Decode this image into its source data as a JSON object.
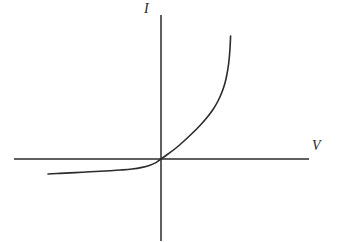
{
  "figure": {
    "background_color": "#ffffff",
    "line_color": "#2b2b2b",
    "width": 339,
    "height": 242
  },
  "labels": {
    "y_axis": "I",
    "x_axis": "V"
  },
  "chart_data": {
    "type": "line",
    "title": "",
    "subtitle": "",
    "xlabel": "V",
    "ylabel": "I",
    "grid": false,
    "legend": null,
    "axes": {
      "origin_px": [
        161,
        159
      ],
      "x_axis_px": {
        "y": 159,
        "x_start": 14,
        "x_end": 309
      },
      "y_axis_px": {
        "x": 161,
        "y_start": 15,
        "y_end": 241
      },
      "x_axis_label_position": "right-end-above",
      "y_axis_label_position": "top-end-left",
      "xlim": [
        -1.0,
        0.78
      ],
      "ylim": [
        -0.12,
        0.96
      ],
      "tick_labels_x": [],
      "tick_labels_y": [],
      "arrowheads": false
    },
    "series": [
      {
        "name": "Diode I-V curve",
        "description": "Exponential forward bias with small negative reverse saturation current",
        "color": "#2b2b2b",
        "line_width_px": 1.6,
        "points_px": [
          [
            48,
            174
          ],
          [
            60,
            173.4
          ],
          [
            75,
            172.6
          ],
          [
            90,
            171.8
          ],
          [
            105,
            171.0
          ],
          [
            120,
            170.0
          ],
          [
            132,
            169.0
          ],
          [
            142,
            167.4
          ],
          [
            150,
            165.2
          ],
          [
            156,
            162.6
          ],
          [
            161,
            159.0
          ],
          [
            168,
            154.0
          ],
          [
            176,
            148.0
          ],
          [
            184,
            141.0
          ],
          [
            192,
            133.5
          ],
          [
            200,
            125.5
          ],
          [
            207,
            117.5
          ],
          [
            213,
            109.5
          ],
          [
            218,
            101.0
          ],
          [
            222,
            92.0
          ],
          [
            225,
            83.0
          ],
          [
            227,
            74.0
          ],
          [
            228.6,
            64.0
          ],
          [
            229.6,
            54.0
          ],
          [
            230.2,
            45.0
          ],
          [
            230.6,
            36.0
          ]
        ],
        "points_data": [
          [
            -0.72,
            -0.064
          ],
          [
            -0.64,
            -0.061
          ],
          [
            -0.54,
            -0.058
          ],
          [
            -0.44,
            -0.055
          ],
          [
            -0.34,
            -0.052
          ],
          [
            -0.24,
            -0.048
          ],
          [
            -0.17,
            -0.044
          ],
          [
            -0.11,
            -0.037
          ],
          [
            -0.06,
            -0.027
          ],
          [
            -0.03,
            -0.016
          ],
          [
            0.0,
            0.0
          ],
          [
            0.04,
            0.021
          ],
          [
            0.09,
            0.047
          ],
          [
            0.14,
            0.077
          ],
          [
            0.19,
            0.109
          ],
          [
            0.24,
            0.143
          ],
          [
            0.29,
            0.177
          ],
          [
            0.33,
            0.212
          ],
          [
            0.36,
            0.248
          ],
          [
            0.39,
            0.286
          ],
          [
            0.41,
            0.325
          ],
          [
            0.43,
            0.363
          ],
          [
            0.44,
            0.406
          ],
          [
            0.45,
            0.449
          ],
          [
            0.46,
            0.487
          ],
          [
            0.46,
            0.525
          ]
        ]
      }
    ],
    "annotations": []
  }
}
